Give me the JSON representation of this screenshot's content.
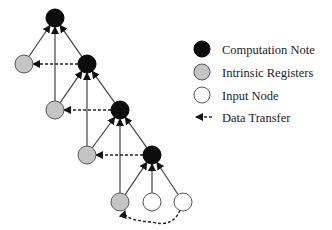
{
  "legend": {
    "items": [
      {
        "label": "Computation Note",
        "kind": "computation",
        "y": 49
      },
      {
        "label": "Intrinsic Registers",
        "kind": "register",
        "y": 72
      },
      {
        "label": "Input Node",
        "kind": "input",
        "y": 95
      },
      {
        "label": "Data Transfer",
        "kind": "transfer",
        "y": 117
      }
    ]
  },
  "colors": {
    "computation": "#0d0d0d",
    "register": "#c4c4c4",
    "input": "#ffffff",
    "edge": "#444444"
  },
  "nodes": [
    {
      "id": "c1",
      "kind": "computation",
      "x": 55,
      "y": 18
    },
    {
      "id": "r1",
      "kind": "register",
      "x": 24,
      "y": 64
    },
    {
      "id": "c2",
      "kind": "computation",
      "x": 87,
      "y": 64
    },
    {
      "id": "r2",
      "kind": "register",
      "x": 55,
      "y": 110
    },
    {
      "id": "c3",
      "kind": "computation",
      "x": 120,
      "y": 110
    },
    {
      "id": "r3",
      "kind": "register",
      "x": 87,
      "y": 155
    },
    {
      "id": "c4",
      "kind": "computation",
      "x": 152,
      "y": 155
    },
    {
      "id": "r4",
      "kind": "register",
      "x": 120,
      "y": 202
    },
    {
      "id": "i1",
      "kind": "input",
      "x": 152,
      "y": 202
    },
    {
      "id": "i2",
      "kind": "input",
      "x": 183,
      "y": 202
    }
  ],
  "edges": [
    {
      "from": "r1",
      "to": "c1"
    },
    {
      "from": "r2",
      "to": "c1"
    },
    {
      "from": "c2",
      "to": "c1"
    },
    {
      "from": "r2",
      "to": "c2"
    },
    {
      "from": "r3",
      "to": "c2"
    },
    {
      "from": "c3",
      "to": "c2"
    },
    {
      "from": "r3",
      "to": "c3"
    },
    {
      "from": "r4",
      "to": "c3"
    },
    {
      "from": "c4",
      "to": "c3"
    },
    {
      "from": "r4",
      "to": "c4"
    },
    {
      "from": "i1",
      "to": "c4"
    },
    {
      "from": "i2",
      "to": "c4"
    }
  ],
  "transfers": [
    {
      "from": "c2",
      "to": "r1"
    },
    {
      "from": "c3",
      "to": "r2"
    },
    {
      "from": "c4",
      "to": "r3"
    },
    {
      "from": "i2",
      "to": "r4",
      "curved": true
    }
  ]
}
